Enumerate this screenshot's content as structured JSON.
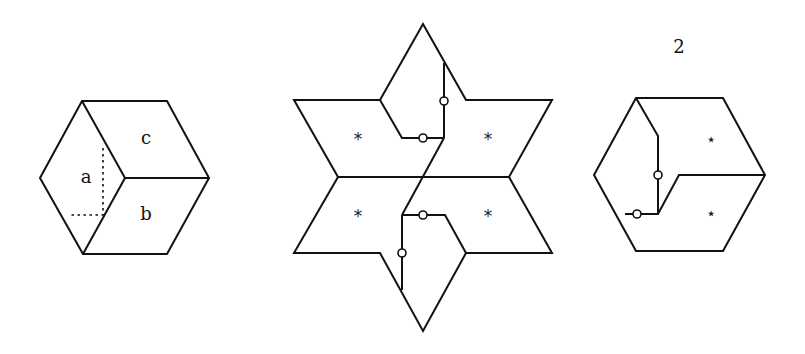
{
  "figure": {
    "left_hexagon": {
      "labels": {
        "a": "a",
        "b": "b",
        "c": "c"
      }
    },
    "middle_star": {
      "region_marks": [
        "*",
        "*",
        "*",
        "*"
      ]
    },
    "right_hexagon": {
      "title": "2",
      "region_marks": [
        "⋆",
        "⋆"
      ]
    }
  },
  "colors": {
    "stroke": "#111111",
    "background": "#ffffff"
  }
}
